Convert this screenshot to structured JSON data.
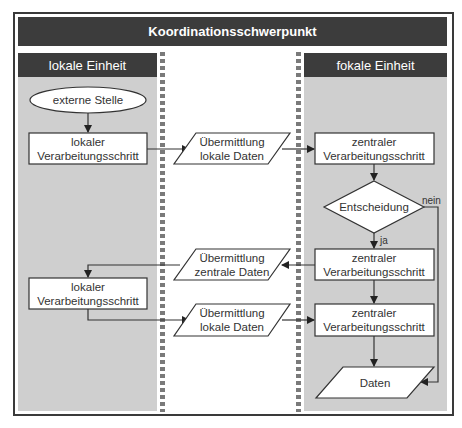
{
  "title": "Koordinationsschwerpunkt",
  "lanes": [
    {
      "label": "lokale Einheit"
    },
    {
      "label": ""
    },
    {
      "label": "fokale Einheit"
    }
  ],
  "nodes": {
    "external": {
      "label": "externe Stelle",
      "shape": "ellipse"
    },
    "local_proc_1": {
      "line1": "lokaler",
      "line2": "Verarbeitungsschritt",
      "shape": "rect"
    },
    "transfer_local_1": {
      "line1": "Übermittlung",
      "line2": "lokale Daten",
      "shape": "parallelogram"
    },
    "central_proc_1": {
      "line1": "zentraler",
      "line2": "Verarbeitungsschritt",
      "shape": "rect"
    },
    "decision": {
      "label": "Entscheidung",
      "shape": "diamond"
    },
    "central_proc_2": {
      "line1": "zentraler",
      "line2": "Verarbeitungsschritt",
      "shape": "rect"
    },
    "transfer_central": {
      "line1": "Übermittlung",
      "line2": "zentrale Daten",
      "shape": "parallelogram"
    },
    "local_proc_2": {
      "line1": "lokaler",
      "line2": "Verarbeitungsschritt",
      "shape": "rect"
    },
    "transfer_local_2": {
      "line1": "Übermittlung",
      "line2": "lokale Daten",
      "shape": "parallelogram"
    },
    "central_proc_3": {
      "line1": "zentraler",
      "line2": "Verarbeitungsschritt",
      "shape": "rect"
    },
    "data": {
      "label": "Daten",
      "shape": "parallelogram"
    }
  },
  "edge_labels": {
    "yes": "ja",
    "no": "nein"
  },
  "colors": {
    "header_bg": "#3c3c3c",
    "lane_bg": "#cfcfcf",
    "line": "#333333",
    "node_fill": "#ffffff"
  }
}
